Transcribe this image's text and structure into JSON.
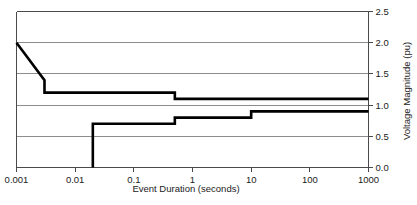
{
  "chart_data": {
    "type": "line",
    "title": "",
    "xlabel": "Event Duration (seconds)",
    "ylabel": "Voltage Magnitude (pu)",
    "xscale": "log",
    "xlim": [
      0.001,
      1000
    ],
    "ylim": [
      0.0,
      2.5
    ],
    "xticks": [
      0.001,
      0.01,
      0.1,
      1,
      10,
      100,
      1000
    ],
    "xticklabels": [
      "0.001",
      "0.01",
      "0.1",
      "1",
      "10",
      "100",
      "1000"
    ],
    "yticks": [
      0.0,
      0.5,
      1.0,
      1.5,
      2.0,
      2.5
    ],
    "yticklabels": [
      "0.0",
      "0.5",
      "1.0",
      "1.5",
      "2.0",
      "2.5"
    ],
    "grid": "horizontal",
    "legend": "none",
    "y_axis_side": "right",
    "series": [
      {
        "name": "upper-overvoltage-limit",
        "points": [
          [
            0.001,
            2.0
          ],
          [
            0.003,
            1.4
          ],
          [
            0.003,
            1.2
          ],
          [
            0.5,
            1.2
          ],
          [
            0.5,
            1.1
          ],
          [
            1000,
            1.1
          ]
        ]
      },
      {
        "name": "lower-undervoltage-limit",
        "points": [
          [
            0.02,
            0.0
          ],
          [
            0.02,
            0.7
          ],
          [
            0.5,
            0.7
          ],
          [
            0.5,
            0.8
          ],
          [
            10,
            0.8
          ],
          [
            10,
            0.9
          ],
          [
            1000,
            0.9
          ]
        ]
      }
    ]
  },
  "colors": {
    "curve": "#000000",
    "grid": "#8d8d8d",
    "axis": "#4a4a4a",
    "text": "#1a1a1a",
    "background": "#ffffff"
  }
}
